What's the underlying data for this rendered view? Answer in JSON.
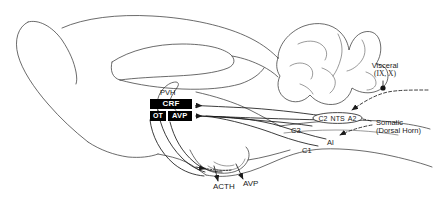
{
  "figure": {
    "background_color": "#ffffff",
    "line_color": "#3a3a3a",
    "box_fill_color": "#000000",
    "box_text_color": "#ffffff"
  },
  "pvh": {
    "region_label": "PVH",
    "crf_label": "CRF",
    "ot_label": "OT",
    "avp_label": "AVP"
  },
  "brainstem_groups": {
    "oval_label_1": "C2",
    "oval_label_2": "NTS",
    "oval_label_3": "A2",
    "c3_label": "C3",
    "a1_label": "Al",
    "c1_label": "C1"
  },
  "afferents": {
    "visceral_line1": "Visceral",
    "visceral_line2": "(IX, X)",
    "somatic_line1": "Somatic",
    "somatic_line2": "(Dorsal Horn)"
  },
  "outputs": {
    "acth_label": "ACTH",
    "avp_label": "AVP"
  }
}
